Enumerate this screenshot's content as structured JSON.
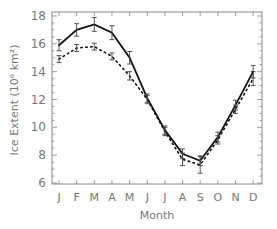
{
  "chart_data": {
    "type": "line",
    "title": "",
    "xlabel": "Month",
    "ylabel": "Ice Extent (10⁶ km²)",
    "categories": [
      "J",
      "F",
      "M",
      "A",
      "M",
      "J",
      "J",
      "A",
      "S",
      "O",
      "N",
      "D"
    ],
    "ylim": [
      6,
      18
    ],
    "yticks": [
      6,
      8,
      10,
      12,
      14,
      16,
      18
    ],
    "grid": false,
    "legend": null,
    "series": [
      {
        "name": "solid",
        "style": "solid",
        "values": [
          15.9,
          17.0,
          17.4,
          16.8,
          15.0,
          12.1,
          9.8,
          8.1,
          7.6,
          9.3,
          11.6,
          14.0
        ],
        "errors": [
          0.4,
          0.45,
          0.5,
          0.5,
          0.45,
          0.3,
          0.3,
          0.35,
          0.35,
          0.35,
          0.35,
          0.45
        ]
      },
      {
        "name": "dotted",
        "style": "dotted",
        "values": [
          14.9,
          15.7,
          15.8,
          15.1,
          13.7,
          12.0,
          9.7,
          7.7,
          7.3,
          9.1,
          11.3,
          13.5
        ],
        "errors": [
          0.25,
          0.25,
          0.25,
          0.25,
          0.3,
          0.3,
          0.3,
          0.45,
          0.6,
          0.3,
          0.3,
          0.5
        ]
      }
    ]
  }
}
